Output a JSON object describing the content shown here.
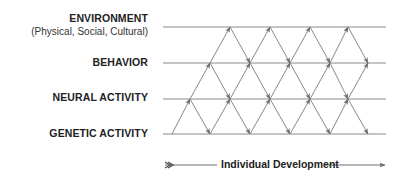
{
  "levels": {
    "environment": {
      "label": "ENVIRONMENT",
      "sublabel": "(Physical, Social, Cultural)"
    },
    "behavior": {
      "label": "BEHAVIOR"
    },
    "neural": {
      "label": "NEURAL ACTIVITY"
    },
    "genetic": {
      "label": "GENETIC ACTIVITY"
    }
  },
  "axis": {
    "label": "Individual Development"
  },
  "colors": {
    "line": "#8a8a8a",
    "arrow": "#6e6e6e",
    "text": "#222222"
  }
}
